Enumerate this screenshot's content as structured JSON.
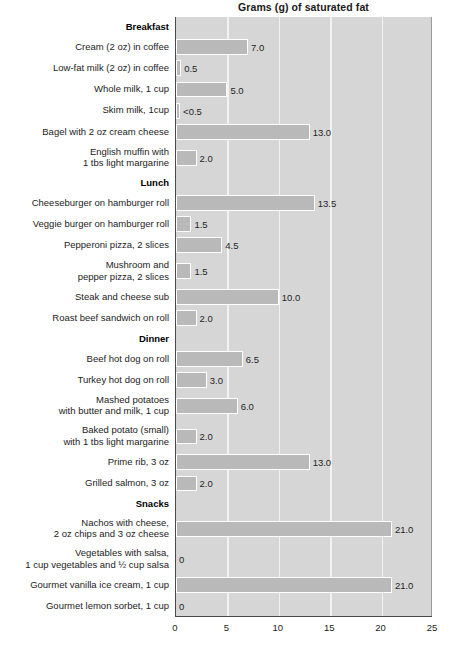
{
  "chart_data": {
    "type": "bar",
    "orientation": "horizontal",
    "title": "Grams (g) of saturated fat",
    "xlabel": "",
    "ylabel": "",
    "xlim": [
      0,
      25
    ],
    "xticks": [
      0,
      5,
      10,
      15,
      20,
      25
    ],
    "grid": true,
    "legend": null,
    "units": "grams (g) of saturated fat",
    "groups": [
      {
        "name": "Breakfast",
        "items": [
          {
            "label": "Cream (2 oz) in coffee",
            "value": 7.0,
            "value_label": "7.0"
          },
          {
            "label": "Low-fat milk (2 oz) in coffee",
            "value": 0.5,
            "value_label": "0.5"
          },
          {
            "label": "Whole milk, 1 cup",
            "value": 5.0,
            "value_label": "5.0"
          },
          {
            "label": "Skim milk, 1cup",
            "value": 0.4,
            "value_label": "<0.5"
          },
          {
            "label": "Bagel with 2 oz cream cheese",
            "value": 13.0,
            "value_label": "13.0"
          },
          {
            "label": "English muffin with\n1 tbs light margarine",
            "value": 2.0,
            "value_label": "2.0"
          }
        ]
      },
      {
        "name": "Lunch",
        "items": [
          {
            "label": "Cheeseburger on hamburger roll",
            "value": 13.5,
            "value_label": "13.5"
          },
          {
            "label": "Veggie burger on hamburger roll",
            "value": 1.5,
            "value_label": "1.5"
          },
          {
            "label": "Pepperoni pizza, 2 slices",
            "value": 4.5,
            "value_label": "4.5"
          },
          {
            "label": "Mushroom and\npepper pizza, 2 slices",
            "value": 1.5,
            "value_label": "1.5"
          },
          {
            "label": "Steak and cheese sub",
            "value": 10.0,
            "value_label": "10.0"
          },
          {
            "label": "Roast beef sandwich on roll",
            "value": 2.0,
            "value_label": "2.0"
          }
        ]
      },
      {
        "name": "Dinner",
        "items": [
          {
            "label": "Beef hot dog on roll",
            "value": 6.5,
            "value_label": "6.5"
          },
          {
            "label": "Turkey hot dog on roll",
            "value": 3.0,
            "value_label": "3.0"
          },
          {
            "label": "Mashed potatoes\nwith butter and milk, 1 cup",
            "value": 6.0,
            "value_label": "6.0"
          },
          {
            "label": "Baked potato (small)\nwith 1 tbs light margarine",
            "value": 2.0,
            "value_label": "2.0"
          },
          {
            "label": "Prime rib, 3 oz",
            "value": 13.0,
            "value_label": "13.0"
          },
          {
            "label": "Grilled salmon, 3 oz",
            "value": 2.0,
            "value_label": "2.0"
          }
        ]
      },
      {
        "name": "Snacks",
        "items": [
          {
            "label": "Nachos with cheese,\n2 oz chips and 3 oz cheese",
            "value": 21.0,
            "value_label": "21.0"
          },
          {
            "label": "Vegetables with salsa,\n1 cup vegetables and ½ cup salsa",
            "value": 0,
            "value_label": "0"
          },
          {
            "label": "Gourmet vanilla ice cream, 1 cup",
            "value": 21.0,
            "value_label": "21.0"
          },
          {
            "label": "Gourmet lemon sorbet, 1 cup",
            "value": 0,
            "value_label": "0"
          }
        ]
      }
    ],
    "colors": {
      "bar_fill": "#b9b9b9",
      "bar_border": "#ffffff",
      "plot_background": "#d6d6d6",
      "gridline": "#f2f2f2",
      "axis": "#4a4a4a",
      "text": "#1c1c1c",
      "page_background": "#ffffff"
    }
  }
}
